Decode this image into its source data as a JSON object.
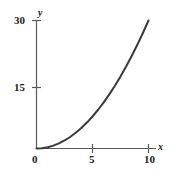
{
  "chart_data": {
    "type": "line",
    "title": "",
    "subtitle": "",
    "xlabel": "x",
    "ylabel": "y",
    "xlim": [
      0,
      10
    ],
    "ylim": [
      0,
      30
    ],
    "xticks": [
      0,
      5,
      10
    ],
    "yticks": [
      0,
      15,
      30
    ],
    "xtick_labels": [
      "0",
      "5",
      "10"
    ],
    "ytick_labels": [
      "",
      "15",
      "30"
    ],
    "grid": false,
    "legend": null,
    "annotations": [],
    "series": [
      {
        "name": "curve",
        "color": "#3a3a3a",
        "linewidth": 2,
        "x": [
          0,
          0.5,
          1,
          1.5,
          2,
          2.5,
          3,
          3.5,
          4,
          4.5,
          5,
          5.5,
          6,
          6.5,
          7,
          7.5,
          8,
          8.5,
          9,
          9.5,
          10
        ],
        "y": [
          0,
          0.08,
          0.3,
          0.68,
          1.2,
          1.88,
          2.7,
          3.68,
          4.8,
          6.08,
          7.5,
          9.08,
          10.8,
          12.68,
          14.7,
          16.88,
          19.2,
          21.68,
          24.3,
          27.08,
          30
        ]
      }
    ]
  },
  "axes": {
    "y_tick_30": "30",
    "y_tick_15": "15",
    "x_tick_0": "0",
    "x_tick_5": "5",
    "x_tick_10": "10",
    "axis_label_x": "x",
    "axis_label_y": "y"
  },
  "colors": {
    "curve": "#3a3a3a",
    "axis": "#5a5a5a",
    "text": "#1a1a1a",
    "background": "#ffffff"
  }
}
